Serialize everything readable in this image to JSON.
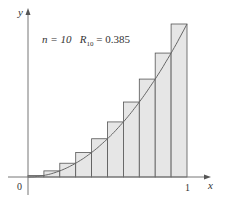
{
  "chart_data": {
    "type": "bar",
    "title": "",
    "annotation": {
      "n_label": "n = 10",
      "r_label": "R",
      "r_sub": "10",
      "r_value": "= 0.385"
    },
    "function": "y = x^2",
    "n": 10,
    "method": "right endpoints",
    "categories": [
      "0-0.1",
      "0.1-0.2",
      "0.2-0.3",
      "0.3-0.4",
      "0.4-0.5",
      "0.5-0.6",
      "0.6-0.7",
      "0.7-0.8",
      "0.8-0.9",
      "0.9-1"
    ],
    "values": [
      0.01,
      0.04,
      0.09,
      0.16,
      0.25,
      0.36,
      0.49,
      0.64,
      0.81,
      1.0
    ],
    "xlabel": "x",
    "ylabel": "y",
    "x_ticks": [
      "0",
      "1"
    ],
    "xlim": [
      0,
      1
    ],
    "ylim": [
      0,
      1
    ],
    "grid": false
  },
  "labels": {
    "y": "y",
    "x": "x",
    "zero": "0",
    "one": "1",
    "n": "n = 10",
    "R": "R",
    "Rsub": "10",
    "Rval": " = 0.385"
  },
  "colors": {
    "bar_fill": "#e6e6e6",
    "bar_stroke": "#555555",
    "curve": "#666666",
    "axis": "#777777"
  }
}
